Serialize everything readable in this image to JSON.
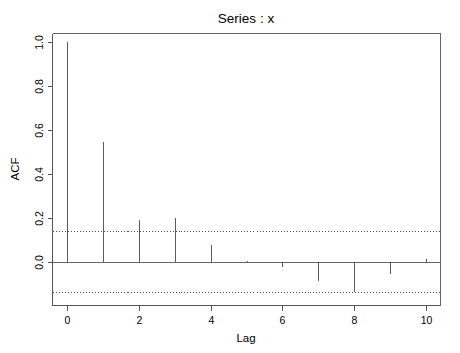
{
  "chart_data": {
    "type": "bar",
    "title": "Series : x",
    "xlabel": "Lag",
    "ylabel": "ACF",
    "categories": [
      0,
      1,
      2,
      3,
      4,
      5,
      6,
      7,
      8,
      9,
      10
    ],
    "x": [
      0,
      1,
      2,
      3,
      4,
      5,
      6,
      7,
      8,
      9,
      10
    ],
    "values": [
      1.0,
      0.545,
      0.19,
      0.2,
      0.075,
      0.005,
      -0.025,
      -0.09,
      -0.14,
      -0.055,
      0.01
    ],
    "series": [
      {
        "name": "ACF",
        "values": [
          1.0,
          0.545,
          0.19,
          0.2,
          0.075,
          0.005,
          -0.025,
          -0.09,
          -0.14,
          -0.055,
          0.01
        ]
      }
    ],
    "xlim": [
      -0.4,
      10.4
    ],
    "ylim": [
      -0.2,
      1.04
    ],
    "xticks": [
      0,
      2,
      4,
      6,
      8,
      10
    ],
    "xtick_labels": [
      "0",
      "2",
      "4",
      "6",
      "8",
      "10"
    ],
    "yticks": [
      0.0,
      0.2,
      0.4,
      0.6,
      0.8,
      1.0
    ],
    "ytick_labels": [
      "0.0",
      "0.2",
      "0.4",
      "0.6",
      "0.8",
      "1.0"
    ],
    "grid": false,
    "legend": null,
    "confidence_bands": {
      "upper": 0.14,
      "lower": -0.14,
      "style": "dotted",
      "level": 0.95
    },
    "zero_line": 0.0,
    "colors": {
      "spike": "#5a5a5a",
      "axis": "#555555",
      "box": "#666666",
      "confidence": "#4a4a4a",
      "background": "#ffffff",
      "text": "#000000"
    }
  },
  "axis": {
    "x_title": "Lag",
    "y_title": "ACF",
    "x_tick_labels": [
      "0",
      "2",
      "4",
      "6",
      "8",
      "10"
    ],
    "y_tick_labels": [
      "0.0",
      "0.2",
      "0.4",
      "0.6",
      "0.8",
      "1.0"
    ]
  },
  "header": {
    "title": "Series : x"
  }
}
